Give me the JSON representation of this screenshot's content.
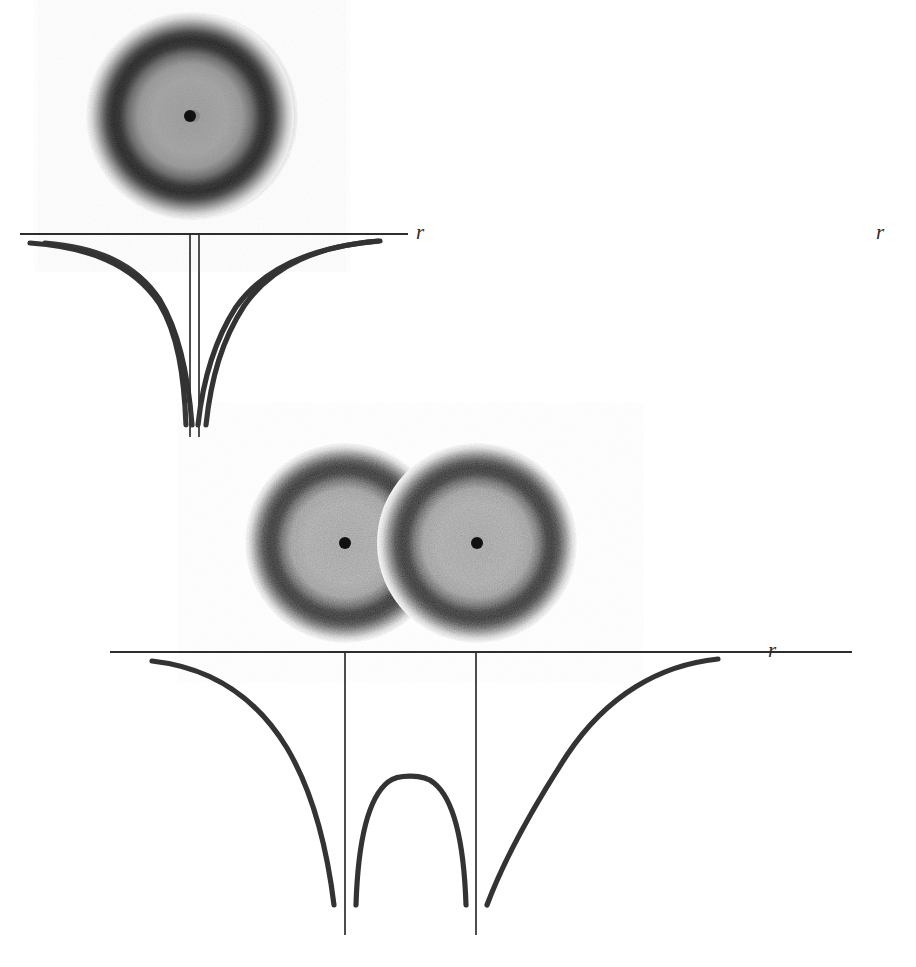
{
  "figure": {
    "title": "",
    "background_color": "#ffffff",
    "ink_color": "#333333",
    "axis_color": "#2e2e2e"
  },
  "axis_label": {
    "r_symbol": "r"
  },
  "blob_style": {
    "core_gray": "#a9a9a9",
    "ring_gray": "#1a1a1a",
    "halo_gray": "#ffffff",
    "dot_color": "#111111",
    "core_radius_frac": 0.52,
    "ring_radius_frac": 0.7,
    "halo_radius_frac": 1.0
  },
  "panels": [
    {
      "id": "top-left",
      "name": "isolated-body-left",
      "blob": {
        "center_x": 194,
        "center_y": 116,
        "radius": 104,
        "dot_radius": 6
      },
      "plot": {
        "h_axis": {
          "x1": 28,
          "x2": 405,
          "y": 234
        },
        "v_axis": {
          "x": 199,
          "y1": 234,
          "y2": 437
        },
        "curve_left": {
          "x_start": 45,
          "x_end": 193,
          "y_top": 243,
          "y_bottom": 425
        },
        "curve_right": {
          "x_start": 205,
          "x_end": 378,
          "y_top": 241,
          "y_bottom": 425
        },
        "r_label_x": 416,
        "r_label_y": 232
      }
    },
    {
      "id": "top-right",
      "name": "isolated-body-right",
      "blob": {
        "center_x": 648,
        "center_y": 116,
        "radius": 104,
        "dot_radius": 6
      },
      "plot": {
        "h_axis": {
          "x1": 478,
          "x2": 866,
          "y": 234
        },
        "v_axis": {
          "x": 648,
          "y1": 234,
          "y2": 437
        },
        "curve_left": {
          "x_start": 488,
          "x_end": 642,
          "y_top": 243,
          "y_bottom": 425
        },
        "curve_right": {
          "x_start": 654,
          "x_end": 838,
          "y_top": 241,
          "y_bottom": 425
        },
        "r_label_x": 876,
        "r_label_y": 232
      }
    },
    {
      "id": "bottom",
      "name": "contact-binary",
      "blobs": [
        {
          "center_x": 345,
          "center_y": 543,
          "radius": 100,
          "dot_radius": 6
        },
        {
          "center_x": 477,
          "center_y": 543,
          "radius": 100,
          "dot_radius": 6
        }
      ],
      "plot": {
        "h_axis": {
          "x1": 110,
          "x2": 852,
          "y": 652
        },
        "v_axis_1": {
          "x": 345,
          "y1": 652,
          "y2": 935
        },
        "v_axis_2": {
          "x": 476,
          "y1": 652,
          "y2": 935
        },
        "curve_left": {
          "x_start": 152,
          "x_end": 338,
          "y_top": 661,
          "y_bottom": 905
        },
        "curve_hump": {
          "x_left": 355,
          "x_right": 468,
          "x_apex": 411,
          "y_apex": 778,
          "y_bottom": 905
        },
        "curve_right": {
          "x_start": 484,
          "x_end": 718,
          "y_top": 659,
          "y_bottom": 905
        },
        "r_label_x": 768,
        "r_label_y": 650
      }
    }
  ],
  "physics": {
    "curve_form": "minus_one_over_r",
    "well_count": 3,
    "binary_saddle": true
  }
}
